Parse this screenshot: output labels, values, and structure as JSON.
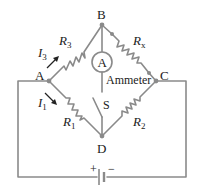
{
  "diagram": {
    "type": "wheatstone-bridge",
    "nodes": {
      "A": "A",
      "B": "B",
      "C": "C",
      "D": "D"
    },
    "components": {
      "R3": {
        "base": "R",
        "sub": "3"
      },
      "Rx": {
        "base": "R",
        "sub": "x"
      },
      "R1": {
        "base": "R",
        "sub": "1"
      },
      "R2": {
        "base": "R",
        "sub": "2"
      },
      "ammeter_symbol": "A",
      "ammeter_label": "Ammeter",
      "switch_label": "S"
    },
    "currents": {
      "I3": {
        "base": "I",
        "sub": "3"
      },
      "I1": {
        "base": "I",
        "sub": "1"
      }
    },
    "battery": {
      "plus": "+",
      "minus": "−"
    },
    "colors": {
      "wire": "#8a8a8a",
      "text": "#222222"
    }
  }
}
